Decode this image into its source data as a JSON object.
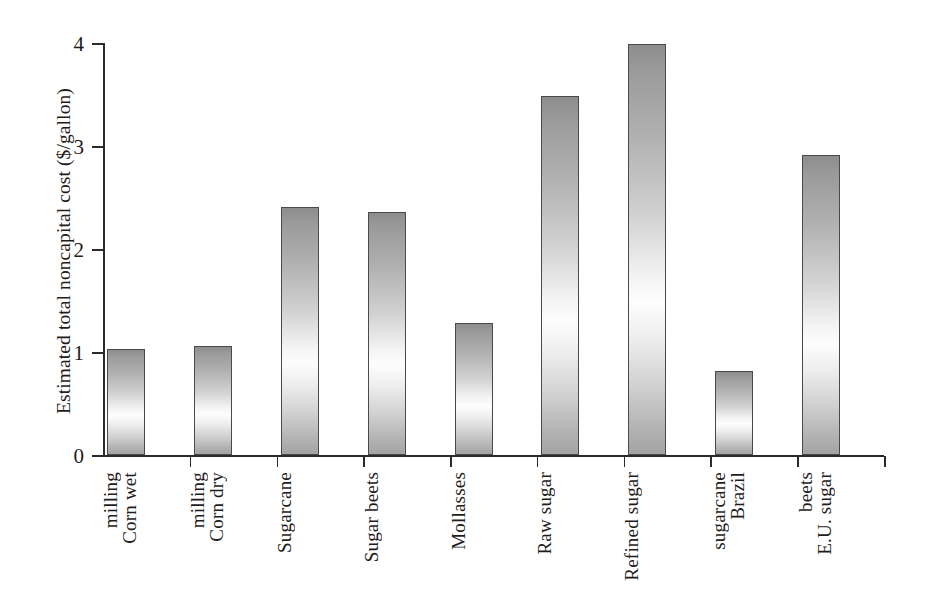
{
  "chart_data": {
    "type": "bar",
    "title": "",
    "xlabel": "",
    "ylabel": "Estimated total noncapital cost  ($/gallon)",
    "ylim": [
      0,
      4
    ],
    "yticks": [
      0,
      1,
      2,
      3,
      4
    ],
    "ytick_labels": [
      "0",
      "1",
      "2",
      "3",
      "4"
    ],
    "grid": false,
    "legend": false,
    "units": "$/gallon",
    "categories": [
      "Corn wet milling",
      "Corn dry milling",
      "Sugarcane",
      "Sugar beets",
      "Mollasses",
      "Raw sugar",
      "Refined sugar",
      "Brazil sugarcane",
      "E.U. sugar beets"
    ],
    "category_lines": [
      [
        "Corn wet",
        "milling"
      ],
      [
        "Corn dry",
        "milling"
      ],
      [
        "Sugarcane"
      ],
      [
        "Sugar beets"
      ],
      [
        "Mollasses"
      ],
      [
        "Raw sugar"
      ],
      [
        "Refined sugar"
      ],
      [
        "Brazil",
        "sugarcane"
      ],
      [
        "E.U. sugar",
        "beets"
      ]
    ],
    "values": [
      1.03,
      1.06,
      2.41,
      2.36,
      1.28,
      3.49,
      3.99,
      0.82,
      2.91
    ],
    "bar_fill": "linear-gradient-gray",
    "bar_edge_color": "#4a4a4a",
    "axis_color": "#2b2b2b",
    "text_color": "#1d1d1d",
    "background": "#ffffff"
  }
}
